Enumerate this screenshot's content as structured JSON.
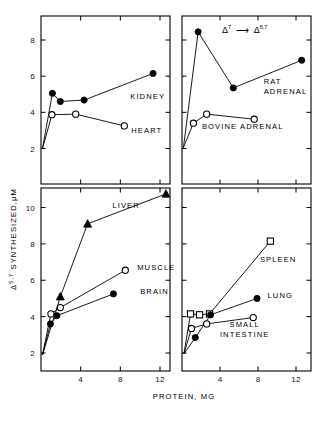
{
  "figure": {
    "title": "",
    "y_axis_label_main": "SYNTHESIZED,",
    "y_axis_label_units": "M",
    "y_axis_label_prefix_delta": "Δ",
    "y_axis_label_prefix_sup": "5,7",
    "y_axis_label_mu": "μ",
    "x_axis_label": "PROTEIN, MG",
    "annotation_left_delta": "Δ",
    "annotation_left_sup": "7",
    "annotation_arrow": "⟶",
    "annotation_right_delta": "Δ",
    "annotation_right_sup": "5,7",
    "color_ink": "#000000",
    "color_bg": "#ffffff"
  },
  "chart_data": {
    "type": "line",
    "xlabel": "PROTEIN, MG",
    "ylabel": "Δ5,7 SYNTHESIZED, μM",
    "xlim": [
      0,
      14
    ],
    "grid": false,
    "legend": "inline-labels",
    "panels": [
      {
        "panel": "top-left",
        "xticks": [
          4,
          8,
          12
        ],
        "yticks": [
          2,
          4,
          6,
          8
        ],
        "ylim": [
          0.6,
          9.2
        ],
        "series": [
          {
            "name": "KIDNEY",
            "marker": "filled-circle",
            "label_x": 9.0,
            "label_y": 4.75,
            "x": [
              0.15,
              1.15,
              1.95,
              4.35,
              11.3
            ],
            "y": [
              2.0,
              5.05,
              4.6,
              4.68,
              6.15
            ]
          },
          {
            "name": "HEART",
            "marker": "open-circle",
            "label_x": 9.1,
            "label_y": 2.85,
            "x": [
              0.15,
              1.1,
              3.5,
              8.4
            ],
            "y": [
              2.0,
              3.87,
              3.9,
              3.25
            ]
          }
        ]
      },
      {
        "panel": "top-right",
        "xticks": [
          4,
          8,
          12
        ],
        "yticks": [
          2,
          4,
          6,
          8
        ],
        "ylim": [
          0.6,
          9.2
        ],
        "series": [
          {
            "name": "RAT ADRENAL",
            "marker": "filled-circle",
            "label_x": 8.6,
            "label_y": 5.55,
            "x": [
              0.15,
              1.7,
              5.4,
              12.6
            ],
            "y": [
              2.05,
              8.45,
              5.35,
              6.88
            ]
          },
          {
            "name": "BOVINE ADRENAL",
            "marker": "open-circle",
            "label_x": 2.1,
            "label_y": 3.1,
            "x": [
              0.15,
              1.2,
              2.6,
              7.6
            ],
            "y": [
              2.05,
              3.4,
              3.9,
              3.62
            ]
          }
        ]
      },
      {
        "panel": "bottom-left",
        "xticks": [
          4,
          8,
          12
        ],
        "yticks": [
          2,
          4,
          6,
          8,
          10
        ],
        "ylim": [
          0.6,
          11.4
        ],
        "series": [
          {
            "name": "LIVER",
            "marker": "filled-triangle",
            "label_x": 7.2,
            "label_y": 10.0,
            "x": [
              0.15,
              1.95,
              4.7,
              12.6
            ],
            "y": [
              1.9,
              5.1,
              9.1,
              10.75
            ]
          },
          {
            "name": "MUSCLE",
            "marker": "open-circle",
            "label_x": 9.7,
            "label_y": 6.55,
            "x": [
              0.15,
              1.0,
              1.95,
              8.5
            ],
            "y": [
              1.9,
              4.15,
              4.5,
              6.55
            ]
          },
          {
            "name": "BRAIN",
            "marker": "filled-circle",
            "label_x": 10.0,
            "label_y": 5.25,
            "x": [
              0.15,
              0.95,
              1.6,
              7.3
            ],
            "y": [
              1.9,
              3.6,
              4.05,
              5.25
            ]
          }
        ]
      },
      {
        "panel": "bottom-right",
        "xticks": [
          4,
          8,
          12
        ],
        "yticks": [
          2,
          4,
          6,
          8,
          10
        ],
        "ylim": [
          0.6,
          11.4
        ],
        "series": [
          {
            "name": "SPLEEN",
            "marker": "open-square",
            "label_x": 8.2,
            "label_y": 7.0,
            "x": [
              0.2,
              0.9,
              1.85,
              2.9,
              9.3
            ],
            "y": [
              1.95,
              4.15,
              4.1,
              4.15,
              8.15
            ]
          },
          {
            "name": "LUNG",
            "marker": "filled-circle",
            "label_x": 9.0,
            "label_y": 5.0,
            "x": [
              0.2,
              1.4,
              3.0,
              7.9
            ],
            "y": [
              1.95,
              2.85,
              4.1,
              5.0
            ]
          },
          {
            "name": "SMALL INTESTINE",
            "marker": "open-circle",
            "label_line1": "SMALL",
            "label_line2": "INTESTINE",
            "label_x": 6.6,
            "label_y": 3.45,
            "x": [
              0.2,
              1.0,
              2.6,
              7.5
            ],
            "y": [
              1.95,
              3.35,
              3.6,
              3.95
            ]
          }
        ]
      }
    ]
  }
}
